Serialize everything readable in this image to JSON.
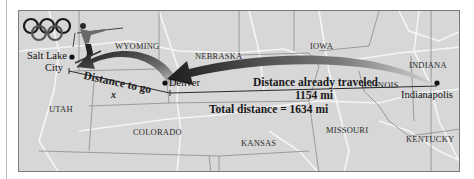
{
  "figure": {
    "states": {
      "wyoming": "WYOMING",
      "nebraska": "NEBRASKA",
      "iowa": "IOWA",
      "indiana": "INDIANA",
      "illinois": "ILLINOIS",
      "utah": "UTAH",
      "colorado": "COLORADO",
      "kansas": "KANSAS",
      "missouri": "MISSOURI",
      "kentucky": "KENTUCKY"
    },
    "cities": {
      "salt_lake_line1": "Salt Lake",
      "salt_lake_line2": "City",
      "denver": "Denver",
      "indianapolis": "Indianapolis"
    },
    "labels": {
      "distance_to_go": "Distance to go",
      "variable": "x",
      "already_traveled": "Distance already traveled",
      "already_traveled_value": "1154 mi",
      "total_distance": "Total distance = 1634 mi"
    },
    "icons": [
      "olympic-rings-icon",
      "skier-icon"
    ],
    "colors": {
      "map_fill": "#d7d7d7",
      "roads": "#f4f4f4",
      "borders": "#8a8a8a",
      "arrow_dark": "#2b2b2b",
      "arrow_light": "#bdbdbd"
    }
  }
}
